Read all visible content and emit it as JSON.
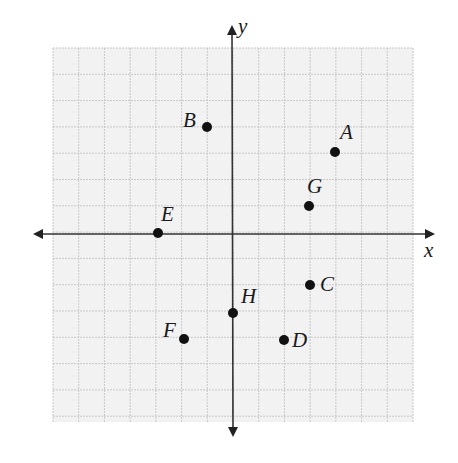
{
  "chart_data": {
    "type": "scatter",
    "title": "",
    "xlabel": "x",
    "ylabel": "y",
    "xlim": [
      -7,
      7
    ],
    "ylim": [
      -7,
      7
    ],
    "grid": true,
    "points": [
      {
        "label": "A",
        "x": 4,
        "y": 3
      },
      {
        "label": "B",
        "x": -1,
        "y": 4
      },
      {
        "label": "C",
        "x": 3,
        "y": -2
      },
      {
        "label": "D",
        "x": 2,
        "y": -4
      },
      {
        "label": "E",
        "x": -3,
        "y": 0
      },
      {
        "label": "F",
        "x": -2,
        "y": -4
      },
      {
        "label": "G",
        "x": 3,
        "y": 1
      },
      {
        "label": "H",
        "x": 0,
        "y": -3
      }
    ]
  },
  "axes": {
    "x_label": "x",
    "y_label": "y"
  },
  "labels": {
    "A": "A",
    "B": "B",
    "C": "C",
    "D": "D",
    "E": "E",
    "F": "F",
    "G": "G",
    "H": "H"
  },
  "colors": {
    "grid_bg": "#f2f2f2",
    "grid_line": "#c8c8c8",
    "axis": "#333333",
    "point": "#111111"
  }
}
